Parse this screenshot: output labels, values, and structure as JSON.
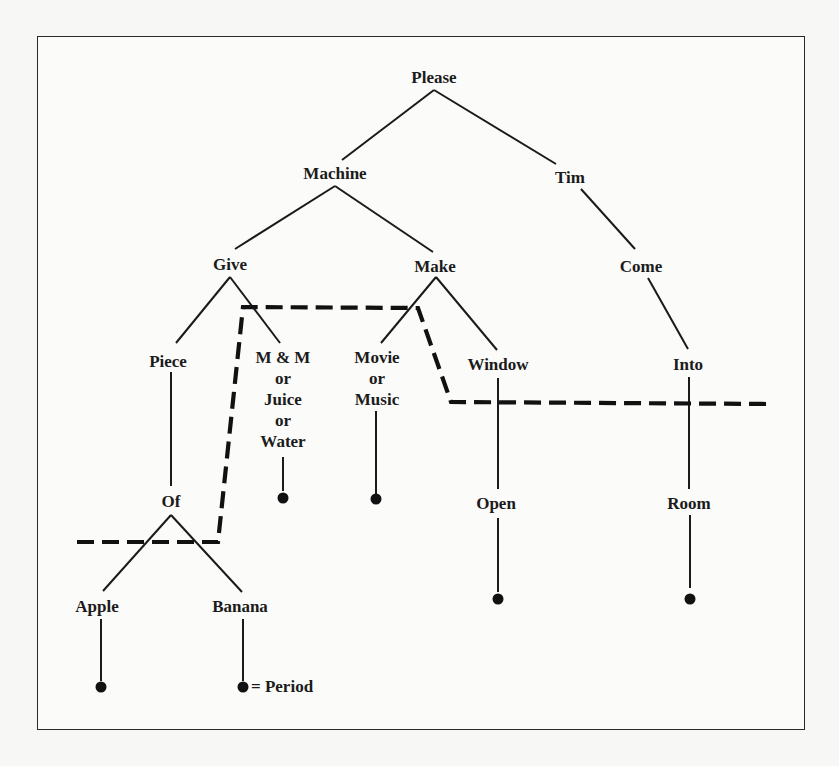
{
  "figure": {
    "type": "word-sequence tree diagram",
    "nodes": {
      "please": {
        "label": "Please"
      },
      "machine": {
        "label": "Machine"
      },
      "tim": {
        "label": "Tim"
      },
      "give": {
        "label": "Give"
      },
      "make": {
        "label": "Make"
      },
      "come": {
        "label": "Come"
      },
      "piece": {
        "label": "Piece"
      },
      "mm_juice_water": {
        "lines": [
          "M & M",
          "or",
          "Juice",
          "or",
          "Water"
        ]
      },
      "movie_music": {
        "lines": [
          "Movie",
          "or",
          "Music"
        ]
      },
      "window": {
        "label": "Window"
      },
      "into": {
        "label": "Into"
      },
      "of": {
        "label": "Of"
      },
      "open": {
        "label": "Open"
      },
      "room": {
        "label": "Room"
      },
      "apple": {
        "label": "Apple"
      },
      "banana": {
        "label": "Banana"
      }
    },
    "edges": [
      [
        "Please",
        "Machine"
      ],
      [
        "Please",
        "Tim"
      ],
      [
        "Machine",
        "Give"
      ],
      [
        "Machine",
        "Make"
      ],
      [
        "Tim",
        "Come"
      ],
      [
        "Come",
        "Into"
      ],
      [
        "Into",
        "Room"
      ],
      [
        "Room",
        "."
      ],
      [
        "Give",
        "Piece"
      ],
      [
        "Give",
        "M & M or Juice or Water"
      ],
      [
        "Make",
        "Movie or Music"
      ],
      [
        "Make",
        "Window"
      ],
      [
        "Piece",
        "Of"
      ],
      [
        "Of",
        "Apple"
      ],
      [
        "Of",
        "Banana"
      ],
      [
        "M & M or Juice or Water",
        "."
      ],
      [
        "Movie or Music",
        "."
      ],
      [
        "Window",
        "Open"
      ],
      [
        "Open",
        "."
      ],
      [
        "Apple",
        "."
      ],
      [
        "Banana",
        "."
      ]
    ],
    "legend": {
      "symbol": "filled-dot",
      "text": "= Period"
    },
    "colors": {
      "line": "#1a1a1a",
      "background": "#fbfbfa"
    }
  }
}
